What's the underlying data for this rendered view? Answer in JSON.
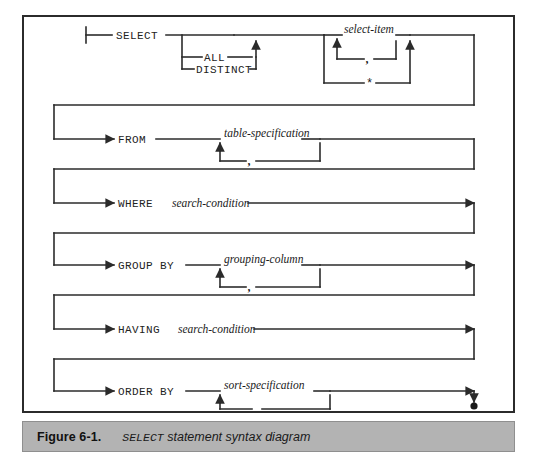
{
  "figure": {
    "number": "Figure 6-1.",
    "caption_keyword": "SELECT",
    "caption_rest": " statement syntax diagram"
  },
  "diagram": {
    "type": "railroad-syntax-diagram",
    "language": "SQL",
    "statement": "SELECT",
    "start_terminal": "start-bar",
    "end_terminal": "filled-dot",
    "clauses": [
      {
        "id": "select",
        "keyword": "SELECT",
        "optional": false,
        "modifiers": [
          "ALL",
          "DISTINCT"
        ],
        "modifier_optional": true,
        "items": [
          {
            "label": "select-item",
            "kind": "nonterminal",
            "repeat_separator": ","
          },
          {
            "label": "*",
            "kind": "terminal"
          }
        ]
      },
      {
        "id": "from",
        "keyword": "FROM",
        "optional": false,
        "items": [
          {
            "label": "table-specification",
            "kind": "nonterminal",
            "repeat_separator": ","
          }
        ]
      },
      {
        "id": "where",
        "keyword": "WHERE",
        "optional": true,
        "items": [
          {
            "label": "search-condition",
            "kind": "nonterminal",
            "repeat_separator": null
          }
        ]
      },
      {
        "id": "group-by",
        "keyword": "GROUP BY",
        "optional": true,
        "items": [
          {
            "label": "grouping-column",
            "kind": "nonterminal",
            "repeat_separator": ","
          }
        ]
      },
      {
        "id": "having",
        "keyword": "HAVING",
        "optional": true,
        "items": [
          {
            "label": "search-condition",
            "kind": "nonterminal",
            "repeat_separator": null
          }
        ]
      },
      {
        "id": "order-by",
        "keyword": "ORDER BY",
        "optional": true,
        "items": [
          {
            "label": "sort-specification",
            "kind": "nonterminal",
            "repeat_separator": ","
          }
        ]
      }
    ],
    "labels": {
      "select": "SELECT",
      "all": "ALL",
      "distinct": "DISTINCT",
      "select_item": "select-item",
      "star": "*",
      "comma": ",",
      "from": "FROM",
      "table_specification": "table-specification",
      "where": "WHERE",
      "search_condition": "search-condition",
      "group_by": "GROUP BY",
      "grouping_column": "grouping-column",
      "having": "HAVING",
      "having_condition": "search-condition",
      "order_by": "ORDER BY",
      "sort_specification": "sort-specification"
    },
    "colors": {
      "line": "#2b2b2b",
      "text": "#1a1a1a",
      "page_background": "#ffffff",
      "caption_background": "#b3b3b3",
      "frame_border": "#2b2b2b"
    }
  }
}
